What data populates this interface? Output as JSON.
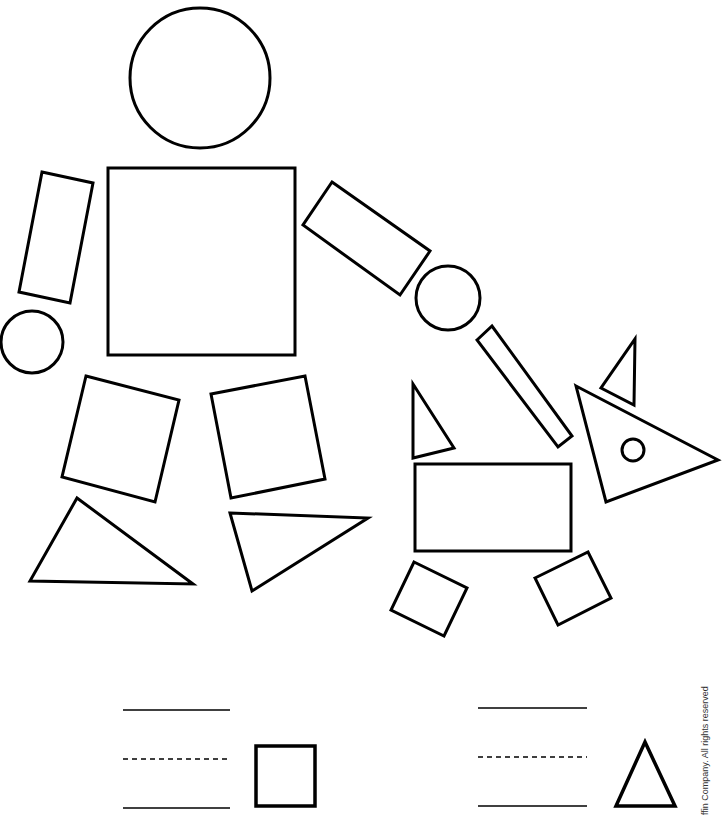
{
  "worksheet": {
    "stroke_color": "#000000",
    "background_color": "#ffffff",
    "figures": {
      "person": {
        "head": {
          "shape": "circle",
          "cx": 200,
          "cy": 78,
          "r": 70
        },
        "body": {
          "shape": "square",
          "points": "108,168 295,168 295,355 108,355"
        },
        "left_arm": {
          "shape": "rectangle",
          "points": "42,172 93,183 70,303 19,292"
        },
        "left_hand": {
          "shape": "circle",
          "cx": 32,
          "cy": 342,
          "r": 31
        },
        "right_arm": {
          "shape": "rectangle",
          "points": "332,182 430,251 400,295 303,225"
        },
        "right_hand": {
          "shape": "circle",
          "cx": 448,
          "cy": 298,
          "r": 32
        },
        "left_leg": {
          "shape": "square",
          "points": "86,376 179,400 155,502 62,477"
        },
        "right_leg": {
          "shape": "square",
          "points": "211,394 305,376 325,479 231,498"
        },
        "left_foot": {
          "shape": "triangle",
          "points": "77,498 193,584 30,581"
        },
        "right_foot": {
          "shape": "triangle",
          "points": "230,513 368,518 252,591"
        }
      },
      "leash": {
        "shape": "rectangle",
        "points": "477,340 492,326 572,436 558,447"
      },
      "dog": {
        "tail": {
          "shape": "triangle",
          "points": "413,384 454,448 413,458"
        },
        "body": {
          "shape": "rectangle",
          "points": "415,464 571,464 571,551 415,551"
        },
        "ear": {
          "shape": "triangle",
          "points": "635,339 634,405 601,388"
        },
        "head": {
          "shape": "triangle",
          "points": "576,386 718,460 606,502"
        },
        "eye": {
          "shape": "circle",
          "cx": 633,
          "cy": 450,
          "r": 11
        },
        "front_leg": {
          "shape": "square",
          "points": "535,578 588,552 611,598 558,625"
        },
        "back_leg": {
          "shape": "square",
          "points": "414,562 467,588 444,636 391,610"
        }
      }
    },
    "answer_rows": [
      {
        "id": "square-count",
        "shape_label": "square",
        "line_x1": 123,
        "line_x2": 230,
        "top_y": 710,
        "mid_y": 759,
        "bottom_y": 808,
        "icon_points": "256,746 315,746 315,806 256,806"
      },
      {
        "id": "triangle-count",
        "shape_label": "triangle",
        "line_x1": 478,
        "line_x2": 587,
        "top_y": 708,
        "mid_y": 757,
        "bottom_y": 806,
        "icon_points": "645,742 616,806 675,806"
      }
    ],
    "copyright_text": "ffin Company. All rights reserved"
  }
}
